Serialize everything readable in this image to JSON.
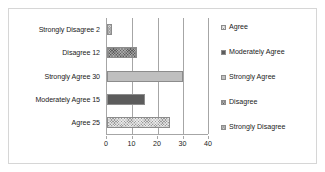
{
  "chart_data": {
    "type": "bar",
    "orientation": "horizontal",
    "title": "",
    "xlabel": "",
    "ylabel": "",
    "categories": [
      "Strongly Disagree 2",
      "Disagree 12",
      "Strongly Agree 30",
      "Moderately Agree 15",
      "Agree 25"
    ],
    "values": [
      2,
      12,
      30,
      15,
      25
    ],
    "bar_series": [
      {
        "category": "Strongly Disagree 2",
        "label": "Strongly Disagree",
        "value": 2,
        "fill": "fill-strongly-disagree",
        "color": "#d2d2d2"
      },
      {
        "category": "Disagree 12",
        "label": "Disagree",
        "value": 12,
        "fill": "fill-disagree",
        "color": "#5c5c5c"
      },
      {
        "category": "Strongly Agree 30",
        "label": "Strongly Agree",
        "value": 30,
        "fill": "fill-strongly-agree",
        "color": "#bfbfbf"
      },
      {
        "category": "Moderately Agree 15",
        "label": "Moderately Agree",
        "value": 15,
        "fill": "fill-moderately-agree",
        "color": "#5c5c5c"
      },
      {
        "category": "Agree 25",
        "label": "Agree",
        "value": 25,
        "fill": "fill-agree",
        "color": "#9a9a9a"
      }
    ],
    "xlim": [
      0,
      40
    ],
    "xticks": [
      0,
      10,
      20,
      30,
      40
    ],
    "xtick_labels": [
      "0",
      "10",
      "20",
      "30",
      "40"
    ],
    "grid": true,
    "grid_axis": "x",
    "legend_position": "right",
    "legend": [
      {
        "label": "Agree",
        "fill": "fill-agree",
        "color": "#9a9a9a"
      },
      {
        "label": "Moderately Agree",
        "fill": "fill-moderately-agree",
        "color": "#5c5c5c"
      },
      {
        "label": "Strongly Agree",
        "fill": "fill-strongly-agree",
        "color": "#bfbfbf"
      },
      {
        "label": "Disagree",
        "fill": "fill-disagree",
        "color": "#5c5c5c"
      },
      {
        "label": "Strongly Disagree",
        "fill": "fill-strongly-disagree",
        "color": "#d2d2d2"
      }
    ],
    "colors": {
      "axis": "#a6a6a6",
      "grid": "#a6a6a6",
      "text": "#1a1a1a",
      "border": "#d6d6d6",
      "background": "#ffffff"
    }
  }
}
